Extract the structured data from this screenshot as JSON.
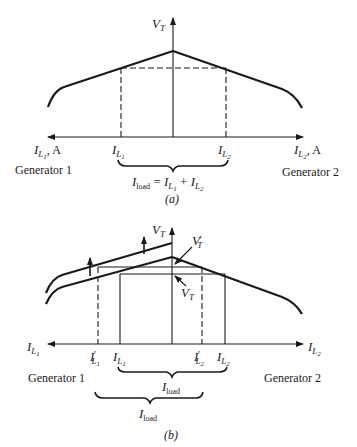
{
  "panel_a": {
    "y_axis_label": "V",
    "y_axis_sub": "T",
    "left_axis_label": "I",
    "left_axis_sub": "L",
    "left_axis_subsub": "1",
    "left_axis_unit": ", A",
    "right_axis_label": "I",
    "right_axis_sub": "L",
    "right_axis_subsub": "2",
    "right_axis_unit": ", A",
    "tick_left": {
      "main": "I",
      "sub": "L",
      "subsub": "1"
    },
    "tick_right": {
      "main": "I",
      "sub": "L",
      "subsub": "2"
    },
    "gen1_label": "Generator 1",
    "gen2_label": "Generator 2",
    "brace_eq": {
      "lhs": "I",
      "lhs_sub": "load",
      "eq": " = ",
      "t1": "I",
      "t1_sub": "L",
      "t1_subsub": "1",
      "plus": " + ",
      "t2": "I",
      "t2_sub": "L",
      "t2_subsub": "2"
    },
    "caption": "(a)"
  },
  "panel_b": {
    "y_axis_label": "V",
    "y_axis_sub": "T",
    "vt_prime_label": "V",
    "vt_prime_sub": "T",
    "vt_prime_mark": "′",
    "vt_label": "V",
    "vt_sub": "T",
    "left_axis_label": "I",
    "left_axis_sub": "L",
    "left_axis_subsub": "1",
    "right_axis_label": "I",
    "right_axis_sub": "L",
    "right_axis_subsub": "2",
    "tick_l1_prime": {
      "main": "I",
      "mark": "′",
      "sub": "L",
      "subsub": "1"
    },
    "tick_l1": {
      "main": "I",
      "sub": "L",
      "subsub": "1"
    },
    "tick_l2_prime": {
      "main": "I",
      "mark": "′",
      "sub": "L",
      "subsub": "2"
    },
    "tick_l2": {
      "main": "I",
      "sub": "L",
      "subsub": "2"
    },
    "gen1_label": "Generator 1",
    "gen2_label": "Generator 2",
    "brace_upper": {
      "main": "I",
      "sub": "load"
    },
    "brace_lower": {
      "main": "I",
      "sub": "load"
    },
    "caption": "(b)"
  },
  "colors": {
    "ink": "#1a1a1a",
    "background": "#ffffff"
  }
}
